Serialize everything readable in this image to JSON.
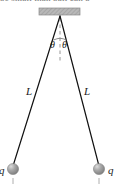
{
  "figure": {
    "name": "two-charged-balls-hanging-diagram",
    "width": 122,
    "height": 189,
    "background": "#ffffff",
    "caption_fragment": "be small than ball  can b"
  },
  "support": {
    "name": "ceiling-support-block",
    "fill": "#b3b3b3",
    "edge": "#8c8c8c",
    "x": 39,
    "y": 8,
    "width": 41,
    "height": 7
  },
  "apex": {
    "x": 60,
    "y": 16
  },
  "dashed_line": {
    "name": "vertical-reference-line",
    "color": "#8a8a8a",
    "x": 60,
    "y1": 18,
    "y2": 62
  },
  "strings": {
    "color": "#111111",
    "left": {
      "x1": 60,
      "y1": 16,
      "x2": 13,
      "y2": 166
    },
    "right": {
      "x1": 60,
      "y1": 16,
      "x2": 99,
      "y2": 166
    }
  },
  "angles": [
    {
      "label": "θ",
      "x": 50,
      "y": 40,
      "side": "left"
    },
    {
      "label": "θ",
      "x": 62,
      "y": 40,
      "side": "right"
    }
  ],
  "lengths": [
    {
      "label": "L",
      "x": 26,
      "y": 86,
      "side": "left"
    },
    {
      "label": "L",
      "x": 84,
      "y": 86,
      "side": "right"
    }
  ],
  "balls": [
    {
      "name": "left-charged-ball",
      "cx": 13,
      "cy": 169,
      "r": 5.6,
      "fill": "#9a9a9a",
      "highlight": "#d8d8d8",
      "charge_label": "q",
      "label_x": -1,
      "label_y": 165,
      "tick": {
        "x": 13,
        "y1": 178,
        "y2": 184
      }
    },
    {
      "name": "right-charged-ball",
      "cx": 99,
      "cy": 169,
      "r": 5.6,
      "fill": "#9a9a9a",
      "highlight": "#d8d8d8",
      "charge_label": "q",
      "label_x": 108,
      "label_y": 165,
      "tick": {
        "x": 99,
        "y1": 178,
        "y2": 184
      }
    }
  ]
}
